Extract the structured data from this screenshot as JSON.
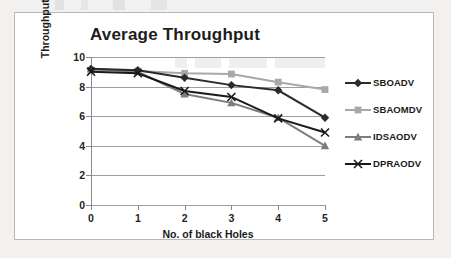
{
  "chart_data": {
    "type": "line",
    "title": "Average Throughput",
    "xlabel": "No. of black Holes",
    "ylabel": "Throughput(kbps)",
    "categories": [
      "0",
      "1",
      "2",
      "3",
      "4",
      "5"
    ],
    "x": [
      0,
      1,
      2,
      3,
      4,
      5
    ],
    "xlim": [
      0,
      5
    ],
    "ylim": [
      0,
      10
    ],
    "yticks": [
      "0",
      "2",
      "4",
      "6",
      "8",
      "10"
    ],
    "ytick_values": [
      0,
      2,
      4,
      6,
      8,
      10
    ],
    "grid": "horizontal",
    "legend_position": "right",
    "series": [
      {
        "name": "SBOADV",
        "marker": "diamond",
        "color": "#2b2b2b",
        "values": [
          9.2,
          9.1,
          8.6,
          8.1,
          7.75,
          5.9
        ]
      },
      {
        "name": "SBAOMDV",
        "marker": "square",
        "color": "#a8a8a8",
        "values": [
          9.1,
          9.05,
          8.9,
          8.85,
          8.3,
          7.8
        ]
      },
      {
        "name": "IDSAODV",
        "marker": "triangle",
        "color": "#7d7d7d",
        "values": [
          9.2,
          9.0,
          7.5,
          6.9,
          5.9,
          4.0
        ]
      },
      {
        "name": "DPRAODV",
        "marker": "x",
        "color": "#1a1a1a",
        "values": [
          9.0,
          8.9,
          7.7,
          7.3,
          5.85,
          4.9
        ]
      }
    ]
  },
  "legend": {
    "items": [
      {
        "label": "SBOADV"
      },
      {
        "label": "SBAOMDV"
      },
      {
        "label": "IDSAODV"
      },
      {
        "label": "DPRAODV"
      }
    ]
  },
  "colors": {
    "series_1": "#2b2b2b",
    "series_2": "#a8a8a8",
    "series_3": "#7d7d7d",
    "series_4": "#1a1a1a",
    "gridline": "#9e9e9e",
    "axis": "#8a8a8a",
    "frame_border": "#b9b9b9",
    "page_background": "#f2f1ef",
    "chart_background": "#ffffff",
    "text": "#1a1a1a"
  }
}
